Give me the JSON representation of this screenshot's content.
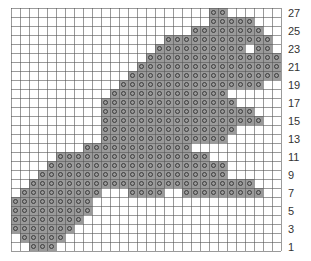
{
  "chart_data": {
    "type": "heatmap",
    "title": "",
    "columns": 30,
    "rows": 27,
    "row_numbering": "bottom-to-top",
    "row_labels": [
      "1",
      "3",
      "5",
      "7",
      "9",
      "11",
      "13",
      "15",
      "17",
      "19",
      "21",
      "23",
      "25",
      "27"
    ],
    "row_label_position": "right",
    "symbol": "diamond-dot-stitch",
    "colors": {
      "filled": "#9a9a9a",
      "empty": "#ffffff",
      "grid": "#555555",
      "symbol": "#333333"
    },
    "filled_ranges_by_row": {
      "27": [
        [
          22,
          23
        ]
      ],
      "26": [
        [
          22,
          26
        ]
      ],
      "25": [
        [
          20,
          27
        ]
      ],
      "24": [
        [
          17,
          28
        ]
      ],
      "23": [
        [
          16,
          25
        ],
        [
          27,
          28
        ]
      ],
      "22": [
        [
          15,
          29
        ]
      ],
      "21": [
        [
          14,
          29
        ]
      ],
      "20": [
        [
          13,
          29
        ]
      ],
      "19": [
        [
          12,
          27
        ]
      ],
      "18": [
        [
          11,
          23
        ]
      ],
      "17": [
        [
          10,
          24
        ]
      ],
      "16": [
        [
          10,
          26
        ]
      ],
      "15": [
        [
          10,
          27
        ]
      ],
      "14": [
        [
          10,
          24
        ]
      ],
      "13": [
        [
          10,
          23
        ]
      ],
      "12": [
        [
          8,
          19
        ]
      ],
      "11": [
        [
          5,
          21
        ]
      ],
      "10": [
        [
          4,
          23
        ]
      ],
      "9": [
        [
          3,
          23
        ]
      ],
      "8": [
        [
          2,
          26
        ]
      ],
      "7": [
        [
          1,
          9
        ],
        [
          13,
          16
        ],
        [
          19,
          27
        ]
      ],
      "6": [
        [
          0,
          8
        ]
      ],
      "5": [
        [
          0,
          8
        ]
      ],
      "4": [
        [
          0,
          7
        ]
      ],
      "3": [
        [
          0,
          6
        ]
      ],
      "2": [
        [
          1,
          5
        ]
      ],
      "1": [
        [
          2,
          4
        ]
      ]
    }
  }
}
